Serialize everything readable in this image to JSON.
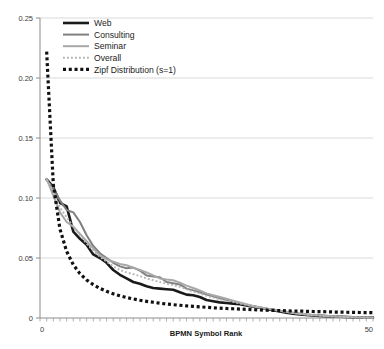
{
  "chart_data": {
    "type": "line",
    "title": "",
    "subtitle": "",
    "xlabel": "BPMN Symbol Rank",
    "ylabel": "",
    "xlim": [
      0,
      50
    ],
    "ylim": [
      0,
      0.25
    ],
    "grid": "horizontal",
    "legend_position": "top-left",
    "x_tick_labels": [
      "0",
      "50"
    ],
    "x_tick_values": [
      0,
      50
    ],
    "x_minor_tick_count": 50,
    "y_tick_labels": [
      "0",
      "0.05",
      "0.10",
      "0.15",
      "0.20",
      "0.25"
    ],
    "y_tick_values": [
      0,
      0.05,
      0.1,
      0.15,
      0.2,
      0.25
    ],
    "x": [
      1,
      2,
      3,
      4,
      5,
      6,
      7,
      8,
      9,
      10,
      11,
      12,
      13,
      14,
      15,
      16,
      17,
      18,
      19,
      20,
      21,
      22,
      23,
      24,
      25,
      26,
      27,
      28,
      29,
      30,
      31,
      32,
      33,
      34,
      35,
      36,
      37,
      38,
      39,
      40,
      41,
      42,
      43,
      44,
      45,
      46,
      47,
      48,
      49,
      50
    ],
    "series": [
      {
        "name": "Web",
        "color": "#1a1a1a",
        "style": "solid",
        "width": 2.6,
        "values": [
          0.1155,
          0.109,
          0.096,
          0.093,
          0.072,
          0.066,
          0.061,
          0.053,
          0.05,
          0.046,
          0.04,
          0.036,
          0.033,
          0.03,
          0.0285,
          0.0265,
          0.025,
          0.0245,
          0.024,
          0.0235,
          0.0215,
          0.0195,
          0.019,
          0.0175,
          0.015,
          0.014,
          0.013,
          0.0125,
          0.012,
          0.0115,
          0.0105,
          0.0095,
          0.0085,
          0.0075,
          0.0065,
          0.0055,
          0.0045,
          0.0035,
          0.003,
          0.0025,
          0.0022,
          0.0018,
          0.0015,
          0.0012,
          0.001,
          0.0008,
          0.0006,
          0.0005,
          0.0004,
          0.0003
        ]
      },
      {
        "name": "Consulting",
        "color": "#808080",
        "style": "solid",
        "width": 2.0,
        "values": [
          0.115,
          0.108,
          0.098,
          0.09,
          0.088,
          0.08,
          0.069,
          0.06,
          0.054,
          0.05,
          0.046,
          0.043,
          0.0415,
          0.042,
          0.0395,
          0.0355,
          0.0345,
          0.034,
          0.03,
          0.029,
          0.028,
          0.0245,
          0.023,
          0.0215,
          0.0195,
          0.018,
          0.0165,
          0.015,
          0.014,
          0.0125,
          0.011,
          0.0095,
          0.0085,
          0.0075,
          0.007,
          0.006,
          0.005,
          0.0042,
          0.0035,
          0.003,
          0.0026,
          0.0022,
          0.0018,
          0.0015,
          0.0012,
          0.001,
          0.0008,
          0.0006,
          0.0005,
          0.0004
        ]
      },
      {
        "name": "Seminar",
        "color": "#a8a8a8",
        "style": "solid",
        "width": 2.0,
        "values": [
          0.116,
          0.102,
          0.088,
          0.08,
          0.076,
          0.07,
          0.064,
          0.058,
          0.052,
          0.049,
          0.047,
          0.045,
          0.044,
          0.042,
          0.04,
          0.038,
          0.0355,
          0.033,
          0.032,
          0.0315,
          0.0295,
          0.027,
          0.025,
          0.023,
          0.0205,
          0.019,
          0.0175,
          0.016,
          0.0145,
          0.013,
          0.0115,
          0.01,
          0.009,
          0.008,
          0.007,
          0.006,
          0.0052,
          0.0044,
          0.0036,
          0.003,
          0.0025,
          0.0021,
          0.0017,
          0.0014,
          0.0011,
          0.0009,
          0.0007,
          0.0005,
          0.0004,
          0.0003
        ]
      },
      {
        "name": "Overall",
        "color": "#b5b5b5",
        "style": "dotted",
        "width": 1.9,
        "values": [
          0.115,
          0.106,
          0.092,
          0.084,
          0.076,
          0.069,
          0.062,
          0.056,
          0.051,
          0.047,
          0.043,
          0.04,
          0.038,
          0.0365,
          0.035,
          0.033,
          0.0315,
          0.03,
          0.0285,
          0.0275,
          0.026,
          0.024,
          0.022,
          0.0205,
          0.0185,
          0.017,
          0.0155,
          0.0145,
          0.0135,
          0.0122,
          0.011,
          0.0098,
          0.0088,
          0.0078,
          0.0068,
          0.0058,
          0.005,
          0.0042,
          0.0035,
          0.0029,
          0.0024,
          0.002,
          0.0016,
          0.0013,
          0.0011,
          0.0009,
          0.0007,
          0.0005,
          0.0004,
          0.0003
        ]
      },
      {
        "name": "Zipf Distribution (s=1)",
        "color": "#111111",
        "style": "dotted",
        "width": 3.2,
        "values": [
          0.222,
          0.111,
          0.074,
          0.0555,
          0.0444,
          0.037,
          0.0317,
          0.0278,
          0.0247,
          0.0222,
          0.0202,
          0.0185,
          0.0171,
          0.0159,
          0.0148,
          0.0139,
          0.0131,
          0.0123,
          0.0117,
          0.0111,
          0.0106,
          0.0101,
          0.0097,
          0.0093,
          0.0089,
          0.0085,
          0.0082,
          0.0079,
          0.0077,
          0.0074,
          0.0072,
          0.0069,
          0.0067,
          0.0065,
          0.0063,
          0.0062,
          0.006,
          0.0058,
          0.0057,
          0.0056,
          0.0054,
          0.0053,
          0.0052,
          0.005,
          0.0049,
          0.0048,
          0.0047,
          0.0046,
          0.0045,
          0.0044
        ]
      }
    ]
  },
  "legend": {
    "items": [
      {
        "label": "Web"
      },
      {
        "label": "Consulting"
      },
      {
        "label": "Seminar"
      },
      {
        "label": "Overall"
      },
      {
        "label": "Zipf Distribution (s=1)"
      }
    ]
  },
  "axes": {
    "x_title": "BPMN Symbol Rank",
    "x_min_label": "0",
    "x_max_label": "50",
    "y_labels": [
      "0.25",
      "0.20",
      "0.15",
      "0.10",
      "0.05",
      "0"
    ]
  },
  "colors": {
    "web": "#1a1a1a",
    "consulting": "#808080",
    "seminar": "#a8a8a8",
    "overall": "#b5b5b5",
    "zipf": "#111111",
    "grid": "#d9d9d9",
    "axis": "#9a9a9a"
  }
}
